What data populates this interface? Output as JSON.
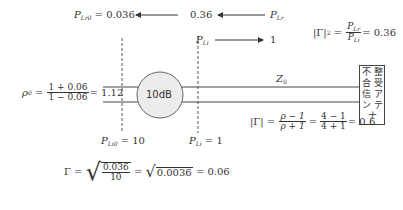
{
  "top": {
    "p_lr0": {
      "symbol": "P",
      "sub": "Lr0",
      "eq": "= 0.036"
    },
    "reflected_value": "0.36",
    "p_lr": {
      "symbol": "P",
      "sub": "Lr"
    },
    "p_li": {
      "symbol": "P",
      "sub": "Li"
    },
    "incident_value": "1",
    "gamma_sq": {
      "lhs": "|Γ|",
      "exp": "2",
      "eq": " = ",
      "num_symbol": "P",
      "num_sub": "Lr",
      "den_symbol": "P",
      "den_sub": "Li",
      "result": "= 0.36"
    }
  },
  "rho0": {
    "lhs": "ρ",
    "lhs_sub": "0",
    "eq": " = ",
    "num": "1 + 0.06",
    "den": "1 − 0.06",
    "result": "= 1.12"
  },
  "attenuator": {
    "label": "10dB",
    "fill": "#ececec"
  },
  "line": {
    "label": "Z",
    "label_sub": "0"
  },
  "antenna": {
    "chars": [
      "不",
      "整",
      "合",
      "受",
      "信",
      "ア",
      "ン",
      "テ",
      "ナ"
    ]
  },
  "gamma_abs": {
    "lhs": "|Γ| = ",
    "num1": "ρ − 1",
    "den1": "ρ + 1",
    "num2": "4 − 1",
    "den2": "4 + 1",
    "result": "= 0.6"
  },
  "bottom_labels": {
    "p_li0": {
      "symbol": "P",
      "sub": "Li0",
      "eq": "= 10"
    },
    "p_li": {
      "symbol": "P",
      "sub": "Li",
      "eq": "= 1"
    }
  },
  "gamma_final": {
    "lhs": "Γ = ",
    "num": "0.036",
    "den": "10",
    "mid": " = ",
    "sqrt2": "0.0036",
    "result": " = 0.06"
  }
}
